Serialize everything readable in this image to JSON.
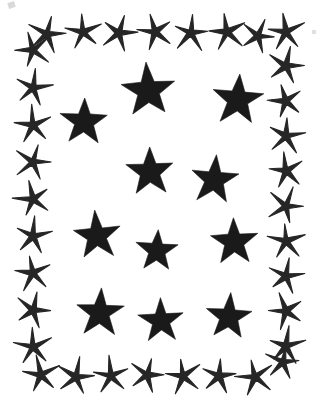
{
  "artwork": {
    "title": "Star border pattern",
    "description": "Rectangular decorative frame of small spiky five-pointed stars enclosing eleven large solid black five-pointed stars",
    "style": "scanned black-and-white clip art",
    "canvas_width": 322,
    "canvas_height": 415,
    "background_color": "#ffffff",
    "ink_color": "#1a1a1a",
    "border_ink_color": "#262626"
  },
  "chart_data": {
    "type": "scatter",
    "title": "Star border pattern",
    "xlabel": "",
    "ylabel": "",
    "xlim": [
      0,
      322
    ],
    "ylim": [
      0,
      415
    ],
    "grid": false,
    "legend": "none",
    "series": [
      {
        "name": "interior-stars",
        "count": 11,
        "marker": "solid-five-point-star",
        "color": "#1a1a1a",
        "points": [
          {
            "id": "interior-1",
            "x": 84,
            "y": 122,
            "r": 25,
            "rot": 2
          },
          {
            "id": "interior-2",
            "x": 148,
            "y": 91,
            "r": 28,
            "rot": -3
          },
          {
            "id": "interior-3",
            "x": 238,
            "y": 100,
            "r": 27,
            "rot": 4
          },
          {
            "id": "interior-4",
            "x": 150,
            "y": 172,
            "r": 25,
            "rot": -2
          },
          {
            "id": "interior-5",
            "x": 214,
            "y": 180,
            "r": 25,
            "rot": 5
          },
          {
            "id": "interior-6",
            "x": 97,
            "y": 236,
            "r": 25,
            "rot": -4
          },
          {
            "id": "interior-7",
            "x": 157,
            "y": 251,
            "r": 22,
            "rot": 3
          },
          {
            "id": "interior-8",
            "x": 234,
            "y": 242,
            "r": 25,
            "rot": -2
          },
          {
            "id": "interior-9",
            "x": 100,
            "y": 313,
            "r": 25,
            "rot": 2
          },
          {
            "id": "interior-10",
            "x": 161,
            "y": 321,
            "r": 23,
            "rot": -3
          },
          {
            "id": "interior-11",
            "x": 229,
            "y": 317,
            "r": 24,
            "rot": 4
          }
        ]
      },
      {
        "name": "border-stars-top",
        "count": 8,
        "marker": "spiky-five-point-star",
        "color": "#262626",
        "points": [
          {
            "id": "top-1",
            "x": 47,
            "y": 34,
            "r": 19,
            "rot": 12
          },
          {
            "id": "top-2",
            "x": 83,
            "y": 32,
            "r": 19,
            "rot": -8
          },
          {
            "id": "top-3",
            "x": 119,
            "y": 33,
            "r": 19,
            "rot": 16
          },
          {
            "id": "top-4",
            "x": 155,
            "y": 32,
            "r": 19,
            "rot": -14
          },
          {
            "id": "top-5",
            "x": 191,
            "y": 33,
            "r": 19,
            "rot": 9
          },
          {
            "id": "top-6",
            "x": 227,
            "y": 32,
            "r": 19,
            "rot": -11
          },
          {
            "id": "top-7",
            "x": 258,
            "y": 36,
            "r": 18,
            "rot": 20
          },
          {
            "id": "top-8",
            "x": 286,
            "y": 32,
            "r": 19,
            "rot": -6
          }
        ]
      },
      {
        "name": "border-stars-bottom",
        "count": 8,
        "marker": "spiky-five-point-star",
        "color": "#262626",
        "points": [
          {
            "id": "bottom-1",
            "x": 41,
            "y": 375,
            "r": 19,
            "rot": -10
          },
          {
            "id": "bottom-2",
            "x": 76,
            "y": 377,
            "r": 19,
            "rot": 14
          },
          {
            "id": "bottom-3",
            "x": 111,
            "y": 376,
            "r": 19,
            "rot": -6
          },
          {
            "id": "bottom-4",
            "x": 147,
            "y": 375,
            "r": 19,
            "rot": 18
          },
          {
            "id": "bottom-5",
            "x": 183,
            "y": 376,
            "r": 19,
            "rot": -12
          },
          {
            "id": "bottom-6",
            "x": 219,
            "y": 376,
            "r": 19,
            "rot": 8
          },
          {
            "id": "bottom-7",
            "x": 255,
            "y": 377,
            "r": 19,
            "rot": -16
          },
          {
            "id": "bottom-8",
            "x": 283,
            "y": 362,
            "r": 18,
            "rot": 10
          }
        ]
      },
      {
        "name": "border-stars-left",
        "count": 9,
        "marker": "spiky-five-point-star",
        "color": "#262626",
        "points": [
          {
            "id": "left-1",
            "x": 33,
            "y": 50,
            "r": 19,
            "rot": -18
          },
          {
            "id": "left-2",
            "x": 33,
            "y": 88,
            "r": 19,
            "rot": 11
          },
          {
            "id": "left-3",
            "x": 33,
            "y": 125,
            "r": 19,
            "rot": -7
          },
          {
            "id": "left-4",
            "x": 33,
            "y": 162,
            "r": 19,
            "rot": 15
          },
          {
            "id": "left-5",
            "x": 33,
            "y": 199,
            "r": 19,
            "rot": -13
          },
          {
            "id": "left-6",
            "x": 33,
            "y": 236,
            "r": 19,
            "rot": 6
          },
          {
            "id": "left-7",
            "x": 33,
            "y": 273,
            "r": 19,
            "rot": -9
          },
          {
            "id": "left-8",
            "x": 33,
            "y": 310,
            "r": 19,
            "rot": 17
          },
          {
            "id": "left-9",
            "x": 33,
            "y": 347,
            "r": 19,
            "rot": -5
          }
        ]
      },
      {
        "name": "border-stars-right",
        "count": 9,
        "marker": "spiky-five-point-star",
        "color": "#262626",
        "points": [
          {
            "id": "right-1",
            "x": 286,
            "y": 66,
            "r": 19,
            "rot": 13
          },
          {
            "id": "right-2",
            "x": 286,
            "y": 101,
            "r": 19,
            "rot": -15
          },
          {
            "id": "right-3",
            "x": 286,
            "y": 136,
            "r": 19,
            "rot": 7
          },
          {
            "id": "right-4",
            "x": 286,
            "y": 171,
            "r": 19,
            "rot": -10
          },
          {
            "id": "right-5",
            "x": 286,
            "y": 206,
            "r": 19,
            "rot": 19
          },
          {
            "id": "right-6",
            "x": 286,
            "y": 241,
            "r": 19,
            "rot": -4
          },
          {
            "id": "right-7",
            "x": 286,
            "y": 276,
            "r": 19,
            "rot": 12
          },
          {
            "id": "right-8",
            "x": 286,
            "y": 311,
            "r": 19,
            "rot": -17
          },
          {
            "id": "right-9",
            "x": 286,
            "y": 346,
            "r": 19,
            "rot": 5
          }
        ]
      }
    ]
  }
}
